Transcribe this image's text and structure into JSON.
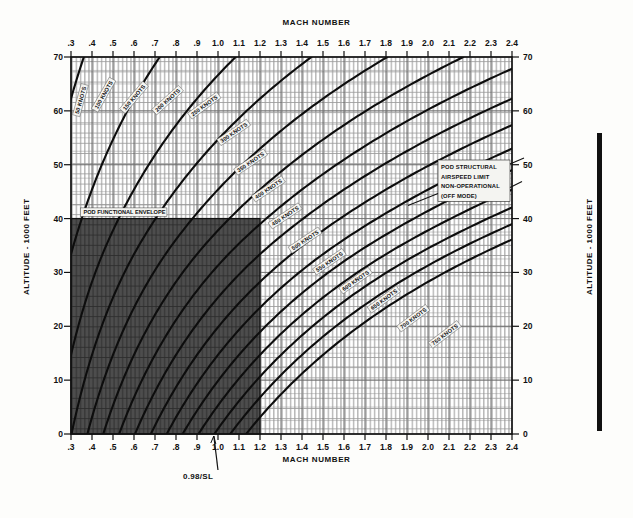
{
  "figure": {
    "top_axis_title": "MACH NUMBER",
    "bottom_axis_title": "MACH NUMBER",
    "left_axis_title": "ALTITUDE - 1000 FEET",
    "right_axis_title": "ALTITUDE - 1000 FEET",
    "envelope_label": "POD FUNCTIONAL ENVELOPE",
    "limit_callout_lines": [
      "POD STRUCTURAL",
      "AIRSPEED LIMIT",
      "NON-OPERATIONAL",
      "(OFF MODE)"
    ],
    "sea_level_note": "0.98/SL"
  },
  "chart_data": {
    "type": "line",
    "xlabel": "MACH NUMBER",
    "ylabel": "ALTITUDE - 1000 FEET",
    "xlim": [
      0.3,
      2.4
    ],
    "ylim": [
      0,
      70
    ],
    "grid": true,
    "legend_position": "inline-curve-labels",
    "x_ticks": [
      0.3,
      0.4,
      0.5,
      0.6,
      0.7,
      0.8,
      0.9,
      1.0,
      1.1,
      1.2,
      1.3,
      1.4,
      1.5,
      1.6,
      1.7,
      1.8,
      1.9,
      2.0,
      2.1,
      2.2,
      2.3,
      2.4
    ],
    "x_tick_labels": [
      ".3",
      ".4",
      ".5",
      ".6",
      ".7",
      ".8",
      ".9",
      "1.0",
      "1.1",
      "1.2",
      "1.3",
      "1.4",
      "1.5",
      "1.6",
      "1.7",
      "1.8",
      "1.9",
      "2.0",
      "2.1",
      "2.2",
      "2.3",
      "2.4"
    ],
    "y_ticks": [
      0,
      10,
      20,
      30,
      40,
      50,
      60,
      70
    ],
    "y_tick_labels": [
      "0",
      "10",
      "20",
      "30",
      "40",
      "50",
      "60",
      "70"
    ],
    "minor_grid_x_step": 0.025,
    "minor_grid_y_step": 2.5,
    "curve_label_suffix": "KNOTS",
    "series": [
      {
        "name": "50 KNOTS",
        "keas": 50,
        "label": "50 KNOTS",
        "label_mach": 0.345,
        "label_alt": 62.0
      },
      {
        "name": "100 KNOTS",
        "keas": 100,
        "label": "100 KNOTS",
        "label_mach": 0.455,
        "label_alt": 63.0
      },
      {
        "name": "150 KNOTS",
        "keas": 150,
        "label": "150 KNOTS",
        "label_mach": 0.6,
        "label_alt": 62.5
      },
      {
        "name": "200 KNOTS",
        "keas": 200,
        "label": "200 KNOTS",
        "label_mach": 0.76,
        "label_alt": 62.0
      },
      {
        "name": "250 KNOTS",
        "keas": 250,
        "label": "250 KNOTS",
        "label_mach": 0.935,
        "label_alt": 61.0
      },
      {
        "name": "300 KNOTS",
        "keas": 300,
        "label": "300 KNOTS",
        "label_mach": 1.075,
        "label_alt": 56.0
      },
      {
        "name": "350 KNOTS",
        "keas": 350,
        "label": "350 KNOTS",
        "label_mach": 1.155,
        "label_alt": 50.5
      },
      {
        "name": "400 KNOTS",
        "keas": 400,
        "label": "400 KNOTS",
        "label_mach": 1.24,
        "label_alt": 45.5
      },
      {
        "name": "450 KNOTS",
        "keas": 450,
        "label": "450 KNOTS",
        "label_mach": 1.32,
        "label_alt": 40.5
      },
      {
        "name": "500 KNOTS",
        "keas": 500,
        "label": "500 KNOTS",
        "label_mach": 1.415,
        "label_alt": 36.0
      },
      {
        "name": "550 KNOTS",
        "keas": 550,
        "label": "550 KNOTS",
        "label_mach": 1.53,
        "label_alt": 32.0
      },
      {
        "name": "600 KNOTS",
        "keas": 600,
        "label": "600 KNOTS",
        "label_mach": 1.655,
        "label_alt": 28.5
      },
      {
        "name": "650 KNOTS",
        "keas": 650,
        "label": "650 KNOTS",
        "label_mach": 1.79,
        "label_alt": 25.0
      },
      {
        "name": "700 KNOTS",
        "keas": 700,
        "label": "700 KNOTS",
        "label_mach": 1.93,
        "label_alt": 21.5
      },
      {
        "name": "750 KNOTS",
        "keas": 750,
        "label": "750 KNOTS",
        "label_mach": 2.08,
        "label_alt": 18.5
      }
    ],
    "shaded_region": {
      "name": "POD FUNCTIONAL ENVELOPE",
      "mach_min": 0.3,
      "mach_max": 1.2,
      "alt_min": 0,
      "alt_max": 40,
      "fill": "#4a4a4a"
    },
    "annotations": [
      {
        "text": "POD FUNCTIONAL ENVELOPE",
        "mach": 0.345,
        "alt": 41.2
      },
      {
        "text": "POD STRUCTURAL AIRSPEED LIMIT NON-OPERATIONAL (OFF MODE)",
        "mach": 1.85,
        "alt": 51.0
      },
      {
        "text": "0.98/SL",
        "mach": 0.78,
        "alt": -8.0
      }
    ]
  }
}
